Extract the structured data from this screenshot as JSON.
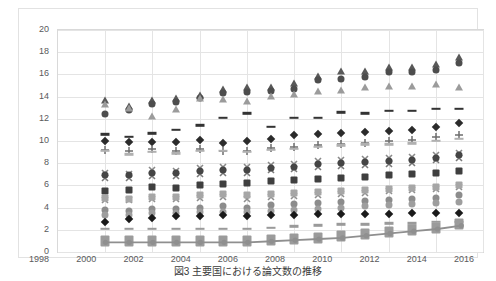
{
  "chart_data": {
    "type": "scatter",
    "title": "",
    "xlabel": "",
    "ylabel": "",
    "xlim": [
      1998,
      2016
    ],
    "ylim": [
      0,
      20
    ],
    "xticks": [
      1998,
      2000,
      2002,
      2004,
      2006,
      2008,
      2010,
      2012,
      2014,
      2016
    ],
    "yticks": [
      0,
      2,
      4,
      6,
      8,
      10,
      12,
      14,
      16,
      18,
      20
    ],
    "grid": "horizontal-and-vertical",
    "legend": "none",
    "x": [
      2000,
      2001,
      2002,
      2003,
      2004,
      2005,
      2006,
      2007,
      2008,
      2009,
      2010,
      2011,
      2012,
      2013,
      2014,
      2015
    ],
    "series": [
      {
        "name": "series-1",
        "marker": "triangle",
        "color": "#595959",
        "values": [
          13.4,
          12.9,
          13.4,
          13.6,
          13.9,
          14.4,
          14.6,
          14.6,
          15.0,
          15.6,
          16.0,
          16.0,
          16.4,
          16.4,
          16.7,
          17.3
        ]
      },
      {
        "name": "series-2",
        "marker": "circle",
        "color": "#4d4d4d",
        "values": [
          12.4,
          12.8,
          13.3,
          13.5,
          13.9,
          14.3,
          14.4,
          14.5,
          14.7,
          15.5,
          15.6,
          15.8,
          16.2,
          16.2,
          16.4,
          17.0
        ]
      },
      {
        "name": "series-3",
        "marker": "triangle-up",
        "color": "#9b9b9b",
        "values": [
          13.1,
          12.7,
          12.0,
          12.6,
          13.6,
          13.5,
          13.3,
          13.8,
          14.0,
          14.2,
          14.3,
          14.6,
          14.7,
          14.7,
          14.9,
          14.6
        ]
      },
      {
        "name": "series-4",
        "marker": "dash",
        "color": "#333333",
        "values": [
          10.6,
          10.4,
          10.7,
          11.0,
          11.4,
          12.1,
          12.5,
          11.3,
          12.1,
          12.1,
          12.6,
          12.5,
          12.7,
          12.7,
          12.9,
          12.9
        ]
      },
      {
        "name": "series-5",
        "marker": "diamond",
        "color": "#2b2b2b",
        "values": [
          10.0,
          9.9,
          9.9,
          9.9,
          10.1,
          9.8,
          10.0,
          10.2,
          10.5,
          10.6,
          10.7,
          10.8,
          10.9,
          11.0,
          11.3,
          11.6
        ]
      },
      {
        "name": "series-6",
        "marker": "plus",
        "color": "#6e6e6e",
        "values": [
          9.7,
          9.6,
          9.8,
          9.6,
          9.8,
          9.6,
          9.6,
          9.9,
          10.0,
          10.2,
          10.3,
          10.4,
          10.5,
          10.6,
          10.9,
          11.1
        ]
      },
      {
        "name": "series-7",
        "marker": "dash-light",
        "color": "#b0b0b0",
        "values": [
          9.1,
          8.8,
          9.0,
          8.9,
          9.1,
          9.1,
          9.0,
          9.2,
          9.3,
          9.5,
          9.6,
          9.7,
          9.7,
          9.8,
          10.0,
          10.2
        ]
      },
      {
        "name": "series-8",
        "marker": "x",
        "color": "#8a8a8a",
        "values": [
          7.7,
          7.6,
          7.9,
          7.8,
          8.1,
          8.2,
          8.2,
          8.4,
          8.5,
          8.7,
          8.8,
          8.9,
          9.0,
          9.1,
          9.3,
          9.5
        ]
      },
      {
        "name": "series-9",
        "marker": "asterisk",
        "color": "#7a7a7a",
        "values": [
          7.2,
          7.2,
          7.4,
          7.4,
          7.6,
          7.7,
          7.7,
          7.9,
          8.0,
          8.2,
          8.3,
          8.4,
          8.5,
          8.6,
          8.8,
          9.0
        ]
      },
      {
        "name": "series-10",
        "marker": "circle-dark",
        "color": "#454545",
        "values": [
          6.9,
          6.9,
          7.1,
          7.1,
          7.3,
          7.4,
          7.4,
          7.6,
          7.7,
          7.9,
          8.0,
          8.1,
          8.2,
          8.3,
          8.5,
          8.7
        ]
      },
      {
        "name": "series-11",
        "marker": "square",
        "color": "#3f3f3f",
        "values": [
          5.5,
          5.6,
          5.9,
          5.8,
          6.0,
          6.1,
          6.2,
          6.4,
          6.5,
          6.6,
          6.7,
          6.8,
          6.9,
          7.0,
          7.1,
          7.3
        ]
      },
      {
        "name": "series-12",
        "marker": "x2",
        "color": "#8f8f8f",
        "values": [
          5.2,
          5.2,
          5.3,
          5.3,
          5.4,
          5.5,
          5.3,
          5.5,
          5.6,
          5.7,
          5.8,
          5.9,
          6.0,
          6.1,
          6.2,
          6.4
        ]
      },
      {
        "name": "series-13",
        "marker": "square-light",
        "color": "#a6a6a6",
        "values": [
          4.9,
          4.8,
          5.0,
          5.0,
          5.1,
          5.2,
          5.1,
          5.2,
          5.3,
          5.4,
          5.5,
          5.6,
          5.7,
          5.8,
          5.9,
          6.0
        ]
      },
      {
        "name": "series-14",
        "marker": "circle-mid",
        "color": "#8c8c8c",
        "values": [
          3.8,
          3.7,
          3.9,
          3.9,
          4.0,
          4.1,
          4.0,
          4.2,
          4.3,
          4.4,
          4.5,
          4.6,
          4.7,
          4.8,
          4.9,
          5.1
        ]
      },
      {
        "name": "series-15",
        "marker": "circle-grey",
        "color": "#9e9e9e",
        "values": [
          3.3,
          3.3,
          3.5,
          3.5,
          3.6,
          3.6,
          3.6,
          3.7,
          3.8,
          3.9,
          4.0,
          4.1,
          4.2,
          4.3,
          4.4,
          4.5
        ]
      },
      {
        "name": "series-16",
        "marker": "diamond-black",
        "color": "#1a1a1a",
        "values": [
          2.7,
          3.0,
          3.1,
          3.2,
          3.2,
          3.3,
          3.2,
          3.3,
          3.3,
          3.4,
          3.4,
          3.4,
          3.4,
          3.5,
          3.5,
          3.5
        ]
      },
      {
        "name": "series-17",
        "marker": "dash-thin",
        "color": "#9a9a9a",
        "values": [
          2.1,
          2.1,
          2.1,
          2.1,
          2.1,
          2.1,
          2.1,
          2.2,
          2.3,
          2.4,
          2.5,
          2.5,
          2.6,
          2.6,
          2.7,
          2.7
        ]
      },
      {
        "name": "trend-line",
        "marker": "square-filled",
        "color": "#9b9b9b",
        "line": true,
        "values": [
          1.0,
          1.0,
          1.0,
          1.0,
          1.0,
          1.0,
          1.0,
          1.1,
          1.2,
          1.3,
          1.4,
          1.6,
          1.8,
          2.0,
          2.2,
          2.5
        ]
      }
    ]
  },
  "caption": {
    "text": "図3  主要国における論文数の推移"
  }
}
